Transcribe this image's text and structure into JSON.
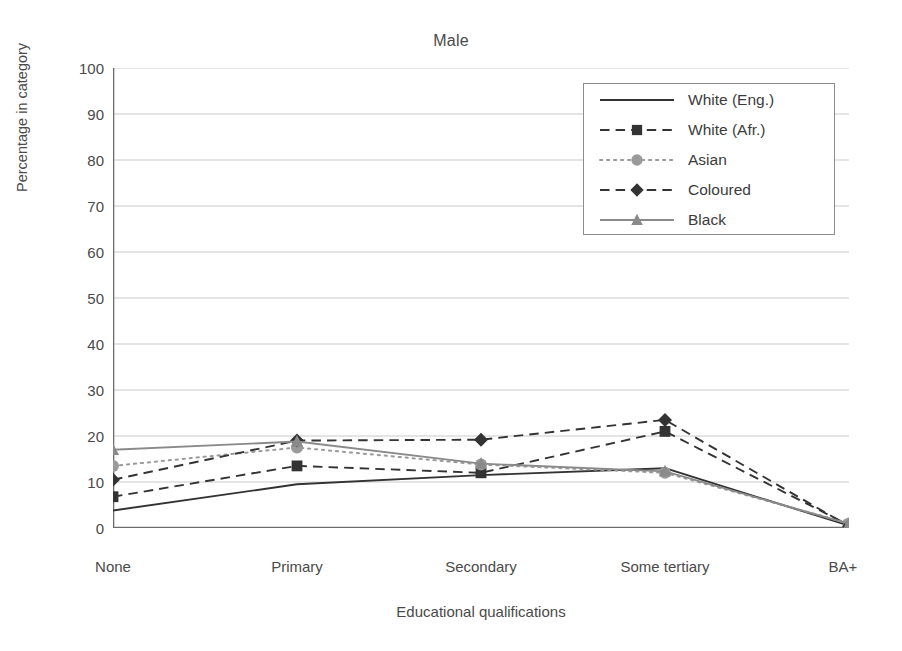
{
  "chart_data": {
    "type": "line",
    "title": "Male",
    "xlabel": "Educational qualifications",
    "ylabel": "Percentage in category",
    "categories": [
      "None",
      "Primary",
      "Secondary",
      "Some tertiary",
      "BA+"
    ],
    "ylim": [
      0,
      100
    ],
    "yticks": [
      0,
      10,
      20,
      30,
      40,
      50,
      60,
      70,
      80,
      90,
      100
    ],
    "grid": "horizontal",
    "legend_position": "top-right",
    "series": [
      {
        "name": "White (Eng.)",
        "values": [
          3.8,
          9.5,
          11.5,
          13.0,
          0.5
        ],
        "color": "#333333",
        "dash": "solid",
        "marker": "none"
      },
      {
        "name": "White (Afr.)",
        "values": [
          6.8,
          13.5,
          12.0,
          21.0,
          0.6
        ],
        "color": "#333333",
        "dash": "dashed",
        "marker": "square"
      },
      {
        "name": "Asian",
        "values": [
          13.5,
          17.5,
          13.8,
          12.0,
          1.0
        ],
        "color": "#9a9a9a",
        "dash": "dotted",
        "marker": "circle"
      },
      {
        "name": "Coloured",
        "values": [
          10.5,
          19.0,
          19.2,
          23.5,
          0.4
        ],
        "color": "#333333",
        "dash": "dashed",
        "marker": "diamond"
      },
      {
        "name": "Black",
        "values": [
          17.0,
          18.8,
          14.0,
          12.3,
          0.9
        ],
        "color": "#8a8a8a",
        "dash": "solid",
        "marker": "triangle"
      }
    ]
  },
  "colors": {
    "axis": "#6d6d6d",
    "grid": "#c9c9c9",
    "text": "#4a4a4a",
    "legend_border": "#8d8d8d",
    "background": "#ffffff"
  }
}
